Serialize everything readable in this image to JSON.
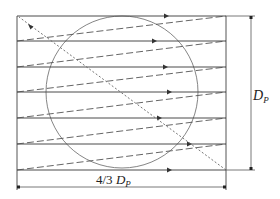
{
  "diagram": {
    "colors": {
      "line": "#555555",
      "solid": "#4a4a4a",
      "dashed": "#555555",
      "dotted": "#666666",
      "circle": "#777777"
    },
    "frame": {
      "x1": 17,
      "y1": 16,
      "x2": 226,
      "y2": 170
    },
    "circle": {
      "cx": 122,
      "cy": 92,
      "r": 76
    },
    "scan_lines": [
      {
        "y": 16,
        "arrow_x": 167
      },
      {
        "y": 41,
        "arrow_x": 155
      },
      {
        "y": 67,
        "arrow_x": 166
      },
      {
        "y": 92,
        "arrow_x": 170
      },
      {
        "y": 118,
        "arrow_x": 160
      },
      {
        "y": 144,
        "arrow_x": 190
      },
      {
        "y": 170,
        "arrow_x": 170
      }
    ],
    "retrace_lines": [
      {
        "from_y": 41,
        "to_y": 16
      },
      {
        "from_y": 67,
        "to_y": 41
      },
      {
        "from_y": 92,
        "to_y": 67
      },
      {
        "from_y": 118,
        "to_y": 92
      },
      {
        "from_y": 144,
        "to_y": 118
      },
      {
        "from_y": 170,
        "to_y": 144
      }
    ],
    "diagonal": {
      "from": [
        226,
        170
      ],
      "to": [
        19,
        17
      ],
      "arrow_at": [
        31,
        27
      ]
    },
    "labels": {
      "height_main": "D",
      "height_sub": "P",
      "width_prefix": "4/3 ",
      "width_main": "D",
      "width_sub": "P"
    },
    "dimensions": {
      "height_line_x": 251,
      "width_line_y": 187
    }
  }
}
